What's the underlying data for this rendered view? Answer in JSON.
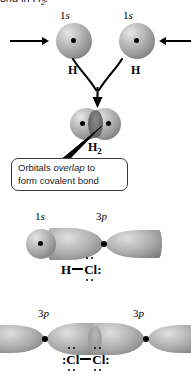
{
  "figure": {
    "caption_tail": "ond in H",
    "caption_tail_sub": "2",
    "caption_tail_end": "."
  },
  "h2_formation": {
    "left_atom": {
      "orbital_label_number": "1",
      "orbital_label_letter": "s",
      "symbol": "H",
      "icon": "sphere-1s-orbital"
    },
    "right_atom": {
      "orbital_label_number": "1",
      "orbital_label_letter": "s",
      "symbol": "H",
      "icon": "sphere-1s-orbital"
    },
    "left_arrow_icon": "arrow-right",
    "right_arrow_icon": "arrow-left",
    "curved_arrow_icon": "curved-converging-arrow",
    "product_symbol": "H",
    "product_sub": "2",
    "product_icon": "overlapping-spheres"
  },
  "callout": {
    "line1_pre": "Orbitals ",
    "line1_em": "overlap",
    "line1_post": " to",
    "line2": "form covalent bond",
    "pointer_icon": "callout-pointer-line"
  },
  "hcl": {
    "left_orbital_number": "1",
    "left_orbital_letter": "s",
    "right_orbital_number": "3",
    "right_orbital_letter": "p",
    "left_icon": "sphere-1s-orbital",
    "right_icon": "p-orbital-dumbbell",
    "lewis": {
      "atom1": "H",
      "bond": "—",
      "atom2": "Cl",
      "atom2_colon": ":",
      "atom2_dots_top": 2,
      "atom2_dots_bottom": 2,
      "atom2_dots_right": 2
    }
  },
  "cl2": {
    "left_orbital_number": "3",
    "left_orbital_letter": "p",
    "right_orbital_number": "3",
    "right_orbital_letter": "p",
    "left_icon": "p-orbital-dumbbell",
    "right_icon": "p-orbital-dumbbell",
    "lewis": {
      "atom1": "Cl",
      "atom1_colon": ":",
      "bond": "—",
      "atom2": "Cl",
      "atom2_colon": ":",
      "dots_top": 2,
      "dots_bottom": 2
    }
  },
  "colors": {
    "orbital_gray_light": "#e0e0e0",
    "orbital_gray_mid": "#b0b0b0",
    "orbital_gray_dark": "#676767",
    "ink": "#000000",
    "background": "#ffffff",
    "callout_border": "#3a3a3a"
  }
}
